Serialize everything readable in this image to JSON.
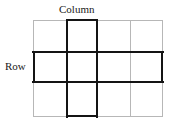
{
  "figure": {
    "type": "grid-diagram",
    "title": "",
    "labels": {
      "column": "Column",
      "row": "Row"
    },
    "grid": {
      "columns": 4,
      "rows": 3,
      "x_lines": [
        33,
        66,
        97,
        130,
        163
      ],
      "y_lines": [
        20,
        51,
        82,
        117
      ],
      "line_color": "#b7b7b7",
      "highlight_color": "#141414"
    },
    "highlight": {
      "highlighted_column_index": 2,
      "highlighted_row_index": 2,
      "shape": "cross"
    },
    "cells": [
      {
        "row": 1,
        "col": 1,
        "highlighted": false
      },
      {
        "row": 1,
        "col": 2,
        "highlighted": true
      },
      {
        "row": 1,
        "col": 3,
        "highlighted": false
      },
      {
        "row": 1,
        "col": 4,
        "highlighted": false
      },
      {
        "row": 2,
        "col": 1,
        "highlighted": true
      },
      {
        "row": 2,
        "col": 2,
        "highlighted": true
      },
      {
        "row": 2,
        "col": 3,
        "highlighted": true
      },
      {
        "row": 2,
        "col": 4,
        "highlighted": true
      },
      {
        "row": 3,
        "col": 1,
        "highlighted": false
      },
      {
        "row": 3,
        "col": 2,
        "highlighted": true
      },
      {
        "row": 3,
        "col": 3,
        "highlighted": false
      },
      {
        "row": 3,
        "col": 4,
        "highlighted": false
      }
    ]
  }
}
